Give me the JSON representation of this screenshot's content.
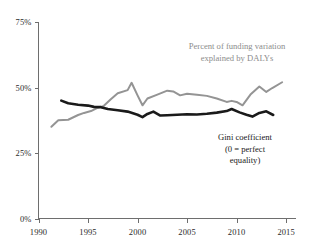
{
  "chart_data": {
    "type": "line",
    "title": "",
    "xlabel": "",
    "ylabel": "",
    "xlim": [
      1990,
      2016
    ],
    "ylim": [
      0,
      75
    ],
    "grid": false,
    "legend_position": "inline-annotation",
    "y_ticks": [
      {
        "value": 75,
        "label": "75%"
      },
      {
        "value": 50,
        "label": "50%"
      },
      {
        "value": 25,
        "label": "25%"
      },
      {
        "value": 0,
        "label": "0%"
      }
    ],
    "x_ticks": [
      {
        "value": 1990,
        "label": "1990"
      },
      {
        "value": 1995,
        "label": "1995"
      },
      {
        "value": 2000,
        "label": "2000"
      },
      {
        "value": 2005,
        "label": "2005"
      },
      {
        "value": 2010,
        "label": "2010"
      },
      {
        "value": 2015,
        "label": "2015"
      }
    ],
    "series": [
      {
        "name": "Percent of funding variation explained by DALYs",
        "color": "#949494",
        "stroke_width": 2.0,
        "x": [
          1991.3,
          1992.0,
          1993.0,
          1994.0,
          1994.6,
          1995.3,
          1996.0,
          1996.6,
          1997.3,
          1998.0,
          1999.0,
          1999.4,
          2000.0,
          2000.5,
          2001.0,
          2002.0,
          2003.0,
          2003.6,
          2004.3,
          2005.0,
          2006.0,
          2007.0,
          2008.0,
          2009.0,
          2009.5,
          2010.0,
          2010.6,
          2011.4,
          2012.3,
          2013.0,
          2013.6,
          2014.6
        ],
        "y": [
          35.0,
          37.5,
          37.7,
          39.5,
          40.3,
          41.0,
          42.3,
          43.0,
          45.5,
          47.8,
          49.0,
          51.8,
          47.0,
          43.2,
          45.8,
          47.3,
          48.8,
          48.5,
          47.0,
          47.6,
          47.2,
          46.8,
          45.8,
          44.5,
          44.9,
          44.5,
          43.2,
          47.3,
          50.4,
          48.3,
          49.8,
          52.0
        ]
      },
      {
        "name": "Gini coefficient (0 = perfect equality)",
        "color": "#1a1a1a",
        "stroke_width": 2.6,
        "x": [
          1992.3,
          1993.0,
          1994.0,
          1995.0,
          1995.6,
          1996.3,
          1997.0,
          1998.0,
          1999.0,
          2000.0,
          2000.5,
          2001.0,
          2001.6,
          2002.3,
          2003.0,
          2004.0,
          2005.0,
          2006.0,
          2007.0,
          2008.0,
          2009.0,
          2009.5,
          2010.3,
          2011.0,
          2011.6,
          2012.3,
          2013.0,
          2013.7
        ],
        "y": [
          45.0,
          44.0,
          43.4,
          43.1,
          42.6,
          42.5,
          41.8,
          41.3,
          40.8,
          39.6,
          38.7,
          39.9,
          40.8,
          39.3,
          39.4,
          39.6,
          39.8,
          39.7,
          40.0,
          40.4,
          41.0,
          41.8,
          40.5,
          39.6,
          38.9,
          40.3,
          40.9,
          39.5
        ]
      }
    ],
    "annotations": [
      {
        "id": "gray-annotation",
        "color": "#8c8c8c",
        "lines": [
          "Percent of funding variation",
          "explained by DALYs"
        ]
      },
      {
        "id": "black-annotation",
        "color": "#1a1a1a",
        "lines": [
          "Gini coefficient",
          "(0 = perfect",
          "equality)"
        ]
      }
    ]
  }
}
